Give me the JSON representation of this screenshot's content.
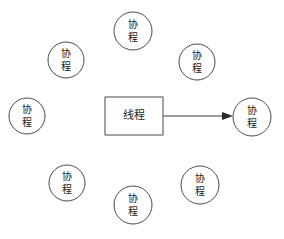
{
  "diagram": {
    "background_color": "#ffffff",
    "stroke_color": "#4a4a4a",
    "arrow_color": "#2b2b2b",
    "text_color": "#222222",
    "thread_node": {
      "id": "thread",
      "label": "线程",
      "label_lines": [
        "线程"
      ],
      "shape": "rectangle",
      "x": 105,
      "y": 97,
      "width": 58,
      "height": 38
    },
    "coroutine_nodes": [
      {
        "id": "coroutine-top-center",
        "label": "协程",
        "label_lines": [
          "协",
          "程"
        ],
        "shape": "circle",
        "cx": 133,
        "cy": 31,
        "r": 19
      },
      {
        "id": "coroutine-upper-left",
        "label": "协程",
        "label_lines": [
          "协",
          "程"
        ],
        "shape": "circle",
        "cx": 66,
        "cy": 60,
        "r": 18
      },
      {
        "id": "coroutine-upper-right",
        "label": "协程",
        "label_lines": [
          "协",
          "程"
        ],
        "shape": "circle",
        "cx": 197,
        "cy": 62,
        "r": 18
      },
      {
        "id": "coroutine-far-left",
        "label": "协程",
        "label_lines": [
          "协",
          "程"
        ],
        "shape": "circle",
        "cx": 27,
        "cy": 116,
        "r": 18
      },
      {
        "id": "coroutine-target-right",
        "label": "协程",
        "label_lines": [
          "协",
          "程"
        ],
        "shape": "circle",
        "cx": 252,
        "cy": 117,
        "r": 19
      },
      {
        "id": "coroutine-lower-left",
        "label": "协程",
        "label_lines": [
          "协",
          "程"
        ],
        "shape": "circle",
        "cx": 67,
        "cy": 183,
        "r": 18
      },
      {
        "id": "coroutine-bottom-center",
        "label": "协程",
        "label_lines": [
          "协",
          "程"
        ],
        "shape": "circle",
        "cx": 133,
        "cy": 205,
        "r": 19
      },
      {
        "id": "coroutine-lower-right",
        "label": "协程",
        "label_lines": [
          "协",
          "程"
        ],
        "shape": "circle",
        "cx": 200,
        "cy": 185,
        "r": 19
      }
    ],
    "edges": [
      {
        "id": "thread-to-coroutine",
        "from": "thread",
        "to": "coroutine-target-right",
        "x1": 163,
        "y1": 116,
        "x2": 233,
        "y2": 116,
        "arrowhead": "triangle",
        "label": ""
      }
    ]
  }
}
